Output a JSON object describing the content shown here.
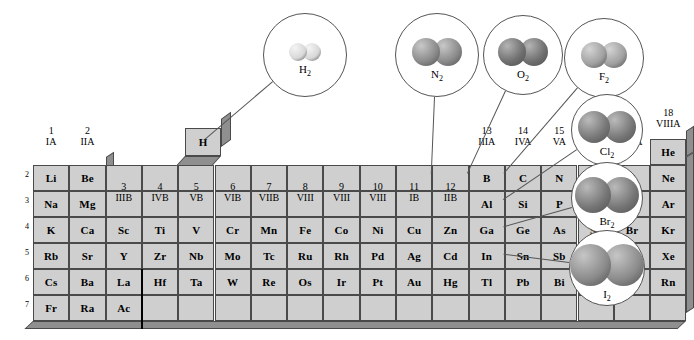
{
  "figure": {
    "cell_fill": "#cfcfcf",
    "cell_border": "#4a4a4a",
    "slab_side": "#8f8f8f",
    "background": "#ffffff"
  },
  "group_headers": [
    {
      "num": "1",
      "rom": "IA"
    },
    {
      "num": "2",
      "rom": "IIA"
    },
    {
      "num": "3",
      "rom": "IIIB"
    },
    {
      "num": "4",
      "rom": "IVB"
    },
    {
      "num": "5",
      "rom": "VB"
    },
    {
      "num": "6",
      "rom": "VIB"
    },
    {
      "num": "7",
      "rom": "VIIB"
    },
    {
      "num": "8",
      "rom": "VIII"
    },
    {
      "num": "9",
      "rom": "VIII"
    },
    {
      "num": "10",
      "rom": "VIII"
    },
    {
      "num": "11",
      "rom": "IB"
    },
    {
      "num": "12",
      "rom": "IIB"
    },
    {
      "num": "13",
      "rom": "IIIA"
    },
    {
      "num": "14",
      "rom": "IVA"
    },
    {
      "num": "15",
      "rom": "VA"
    },
    {
      "num": "16",
      "rom": "VIA"
    },
    {
      "num": "17",
      "rom": "VIIA"
    },
    {
      "num": "18",
      "rom": "VIIIA"
    }
  ],
  "period_labels": [
    "2",
    "3",
    "4",
    "5",
    "6",
    "7"
  ],
  "hydrogen_cell": {
    "symbol": "H"
  },
  "helium_cell": {
    "symbol": "He"
  },
  "rows": [
    {
      "period": "2",
      "cells": [
        "Li",
        "Be",
        "",
        "",
        "",
        "",
        "",
        "",
        "",
        "",
        "",
        "",
        "B",
        "C",
        "N",
        "O",
        "F",
        "Ne"
      ]
    },
    {
      "period": "3",
      "cells": [
        "Na",
        "Mg",
        "",
        "",
        "",
        "",
        "",
        "",
        "",
        "",
        "",
        "",
        "Al",
        "Si",
        "P",
        "S",
        "Cl",
        "Ar"
      ]
    },
    {
      "period": "4",
      "cells": [
        "K",
        "Ca",
        "Sc",
        "Ti",
        "V",
        "Cr",
        "Mn",
        "Fe",
        "Co",
        "Ni",
        "Cu",
        "Zn",
        "Ga",
        "Ge",
        "As",
        "Se",
        "Br",
        "Kr"
      ]
    },
    {
      "period": "5",
      "cells": [
        "Rb",
        "Sr",
        "Y",
        "Zr",
        "Nb",
        "Mo",
        "Tc",
        "Ru",
        "Rh",
        "Pd",
        "Ag",
        "Cd",
        "In",
        "Sn",
        "Sb",
        "Te",
        "I",
        "Xe"
      ]
    },
    {
      "period": "6",
      "cells": [
        "Cs",
        "Ba",
        "La",
        "Hf",
        "Ta",
        "W",
        "Re",
        "Os",
        "Ir",
        "Pt",
        "Au",
        "Hg",
        "Tl",
        "Pb",
        "Bi",
        "Po",
        "At",
        "Rn"
      ]
    },
    {
      "period": "7",
      "cells": [
        "Fr",
        "Ra",
        "Ac",
        "",
        "",
        "",
        "",
        "",
        "",
        "",
        "",
        "",
        "",
        "",
        "",
        "",
        "",
        ""
      ]
    }
  ],
  "molecules": [
    {
      "name": "H2",
      "label": "H",
      "sub": "2",
      "cx": 305,
      "cy": 55,
      "r": 42,
      "atom": 9,
      "color": "#d8d8d8",
      "shade": "#f4f4f4",
      "target_x": 205,
      "target_y": 140
    },
    {
      "name": "N2",
      "label": "N",
      "sub": "2",
      "cx": 437,
      "cy": 55,
      "r": 42,
      "atom": 14,
      "color": "#8a8a8a",
      "shade": "#c8c8c8",
      "target_x": 432,
      "target_y": 174
    },
    {
      "name": "O2",
      "label": "O",
      "sub": "2",
      "cx": 523,
      "cy": 55,
      "r": 40,
      "atom": 14,
      "color": "#6f6f6f",
      "shade": "#b4b4b4",
      "target_x": 468,
      "target_y": 174
    },
    {
      "name": "F2",
      "label": "F",
      "sub": "2",
      "cx": 604,
      "cy": 58,
      "r": 40,
      "atom": 13,
      "color": "#a0a0a0",
      "shade": "#d4d4d4",
      "target_x": 504,
      "target_y": 174
    },
    {
      "name": "Cl2",
      "label": "Cl",
      "sub": "2",
      "cx": 607,
      "cy": 130,
      "r": 36,
      "atom": 16,
      "color": "#777777",
      "shade": "#bbbbbb",
      "target_x": 504,
      "target_y": 200
    },
    {
      "name": "Br2",
      "label": "Br",
      "sub": "2",
      "cx": 607,
      "cy": 198,
      "r": 36,
      "atom": 18,
      "color": "#767676",
      "shade": "#bababa",
      "target_x": 504,
      "target_y": 227
    },
    {
      "name": "I2",
      "label": "I",
      "sub": "2",
      "cx": 607,
      "cy": 268,
      "r": 38,
      "atom": 21,
      "color": "#8b8b8b",
      "shade": "#c6c6c6",
      "target_x": 504,
      "target_y": 255
    }
  ]
}
